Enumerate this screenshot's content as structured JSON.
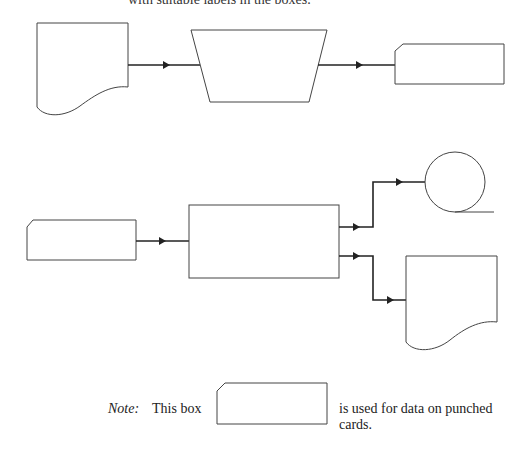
{
  "header": {
    "cropped_text": "with suitable labels in the boxes."
  },
  "diagram_top": {
    "nodes": [
      {
        "id": "document-1",
        "shape": "document"
      },
      {
        "id": "manual-operation",
        "shape": "trapezoid"
      },
      {
        "id": "punched-card-1",
        "shape": "punched-card"
      }
    ],
    "edges": [
      {
        "from": "document-1",
        "to": "manual-operation"
      },
      {
        "from": "manual-operation",
        "to": "punched-card-1"
      }
    ]
  },
  "diagram_bottom": {
    "nodes": [
      {
        "id": "punched-card-2",
        "shape": "punched-card"
      },
      {
        "id": "process",
        "shape": "rectangle"
      },
      {
        "id": "magnetic-tape",
        "shape": "tape-reel"
      },
      {
        "id": "document-2",
        "shape": "document"
      }
    ],
    "edges": [
      {
        "from": "punched-card-2",
        "to": "process"
      },
      {
        "from": "process",
        "to": "magnetic-tape"
      },
      {
        "from": "process",
        "to": "document-2"
      }
    ]
  },
  "note": {
    "label": "Note:",
    "prefix": "This box",
    "description": "is used for data on punched cards."
  },
  "colors": {
    "stroke": "#333333",
    "background": "#ffffff"
  }
}
